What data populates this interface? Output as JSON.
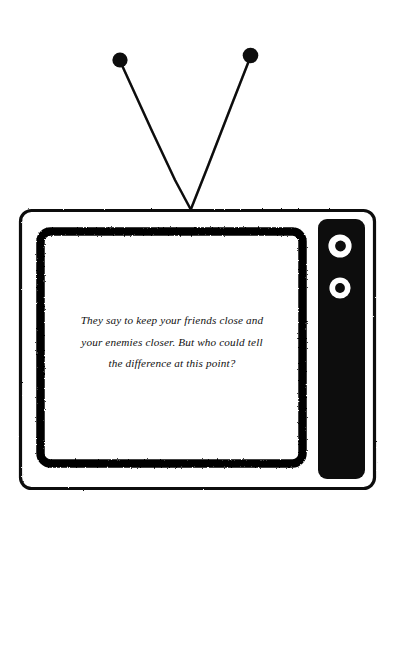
{
  "artwork": {
    "title": "retro-television-illustration",
    "style": "hand-inked black and white stamp illustration",
    "background_color": "#ffffff",
    "ink_color": "#000000"
  },
  "television": {
    "name": "vintage-tv-set",
    "outer_frame": {
      "label": "tv-outer-cabinet",
      "x": 19,
      "y": 209,
      "width": 357,
      "height": 281,
      "corner_radius": 11,
      "stroke_color": "#0a0a0a",
      "stroke_width": 3
    },
    "screen_bezel": {
      "label": "tv-screen-bezel",
      "x": 36,
      "y": 227,
      "width": 268,
      "height": 240,
      "corner_radius": 11,
      "stroke_color": "#060606",
      "stroke_width": 9
    },
    "screen_surface": {
      "label": "tv-screen-surface",
      "fill_color": "#ffffff"
    },
    "control_panel": {
      "label": "tv-control-panel",
      "x": 318,
      "y": 219,
      "width": 47,
      "height": 260,
      "corner_radius": 9,
      "fill_color": "#0a0a0a",
      "knobs": [
        {
          "name": "channel-knob",
          "cx": 340,
          "cy": 246,
          "outer_r": 11.5,
          "ring_r": 7.5,
          "inner_r": 5.0,
          "ring_color": "#ffffff",
          "center_color": "#0a0a0a"
        },
        {
          "name": "volume-knob",
          "cx": 340,
          "cy": 288,
          "outer_r": 10.5,
          "ring_r": 7.0,
          "inner_r": 4.6,
          "ring_color": "#ffffff",
          "center_color": "#0a0a0a"
        }
      ]
    }
  },
  "antenna": {
    "name": "rabbit-ear-antenna",
    "apex": {
      "x": 190,
      "y": 209
    },
    "left_rod": {
      "name": "antenna-rod-left",
      "tip_x": 120,
      "tip_y": 61,
      "tip_radius": 7.5,
      "stroke_width": 2.6
    },
    "right_rod": {
      "name": "antenna-rod-right",
      "tip_x": 250,
      "tip_y": 57,
      "tip_radius": 7.5,
      "stroke_width": 2.6
    },
    "color": "#0a0a0a"
  },
  "screen_message": {
    "name": "tv-screen-caption",
    "lines": [
      "They say to keep your friends close and",
      "your enemies closer. But who could tell",
      "the difference at this point?"
    ],
    "full_text": "They say to keep your friends close and your enemies closer. But who could tell the difference at this point?",
    "text_color": "#111111",
    "alignment": "center",
    "font_style": "italic serif"
  }
}
